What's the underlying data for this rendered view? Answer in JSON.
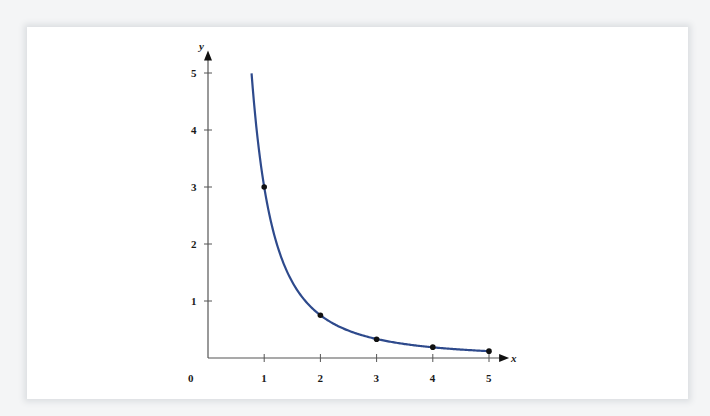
{
  "chart_data": {
    "type": "line",
    "title": "",
    "xlabel": "x",
    "ylabel": "y",
    "origin_label": "0",
    "x_ticks": [
      "1",
      "2",
      "3",
      "4",
      "5"
    ],
    "y_ticks": [
      "1",
      "2",
      "3",
      "4",
      "5"
    ],
    "xlim": [
      0,
      5.3
    ],
    "ylim": [
      0,
      5.3
    ],
    "grid": false,
    "series": [
      {
        "name": "y = 3/x^2",
        "color": "#2e4a8c",
        "curve_x_range": [
          0.775,
          5
        ],
        "points": [
          {
            "x": 1,
            "y": 3
          },
          {
            "x": 2,
            "y": 0.75
          },
          {
            "x": 3,
            "y": 0.33
          },
          {
            "x": 4,
            "y": 0.19
          },
          {
            "x": 5,
            "y": 0.12
          }
        ]
      }
    ]
  }
}
